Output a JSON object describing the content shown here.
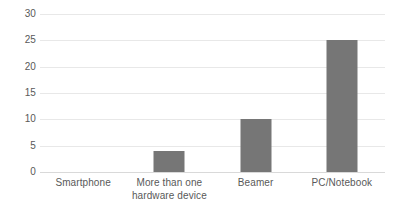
{
  "chart_data": {
    "type": "bar",
    "title": "",
    "subtitle": "",
    "xlabel": "",
    "ylabel": "",
    "categories": [
      "Smartphone",
      "More than one hardware device",
      "Beamer",
      "PC/Notebook"
    ],
    "category_lines": [
      [
        "Smartphone"
      ],
      [
        "More than one",
        "hardware device"
      ],
      [
        "Beamer"
      ],
      [
        "PC/Notebook"
      ]
    ],
    "values": [
      0,
      4,
      10,
      25
    ],
    "ylim": [
      0,
      30
    ],
    "ytick_step": 5,
    "yticks": [
      30,
      25,
      20,
      15,
      10,
      5,
      0
    ],
    "ytick_labels": [
      "30",
      "25",
      "20",
      "15",
      "10",
      "5",
      "0"
    ],
    "grid": true,
    "grid_axis": "y",
    "legend": false,
    "legend_position": "none",
    "annotations": [],
    "colors": {
      "bar": "#767676",
      "gridline": "#e8e8e8",
      "baseline": "#d9d9d9",
      "text": "#595959",
      "background": "#ffffff"
    }
  }
}
